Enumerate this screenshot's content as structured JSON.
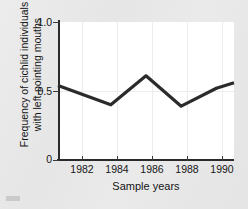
{
  "figure": {
    "background_color": "#e8e8e8",
    "plot_background_color": "#ffffff",
    "line_color": "#2b2b2b",
    "grid_color": "#ededed",
    "axis_color": "#2a2a2a"
  },
  "chart_data": {
    "type": "line",
    "title": "",
    "xlabel": "Sample years",
    "ylabel": "Frequency of cichlid individuals with left-pointing mouths",
    "ylabel_line1": "Frequency of cichlid individuals",
    "ylabel_line2": "with left-pointing mouths",
    "xlim": [
      1981,
      1991
    ],
    "ylim": [
      0,
      1.0
    ],
    "xticks": [
      1982,
      1984,
      1986,
      1988,
      1990
    ],
    "xtick_labels": [
      "1982",
      "1984",
      "1986",
      "1988",
      "1990"
    ],
    "yticks": [
      0,
      0.5,
      1.0
    ],
    "ytick_labels": [
      "0",
      "0.5",
      "1.0"
    ],
    "grid": "vertical-and-half-horizontal",
    "legend": "none",
    "x": [
      1981,
      1984,
      1986,
      1988,
      1990,
      1991
    ],
    "values": [
      0.54,
      0.4,
      0.61,
      0.39,
      0.52,
      0.56
    ],
    "series": [
      {
        "name": "Frequency of left-pointing mouths",
        "x": [
          1981,
          1984,
          1986,
          1988,
          1990,
          1991
        ],
        "values": [
          0.54,
          0.4,
          0.61,
          0.39,
          0.52,
          0.56
        ]
      }
    ]
  }
}
